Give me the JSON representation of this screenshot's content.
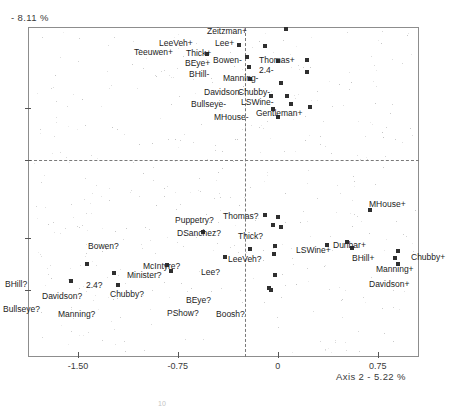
{
  "figure": {
    "y_axis_caption": "- 8.11 %",
    "x_axis_caption": "Axis 2  -  5.22 %",
    "artifact": "10"
  },
  "chart_data": {
    "type": "scatter",
    "title": "",
    "xlabel": "Axis 2  -  5.22 %",
    "ylabel": "- 8.11 %",
    "xlim": [
      -1.875,
      1.06
    ],
    "ylim": [
      -1.27,
      1.52
    ],
    "grid": false,
    "legend": null,
    "xticks": [
      -1.5,
      -0.75,
      0,
      0.75
    ],
    "xticklabels": [
      "-1.50",
      "-0.75",
      "0",
      "0.75"
    ],
    "yticks_unlabeled": 4,
    "reference_lines": {
      "vertical_x": 0,
      "horizontal_y": 0,
      "style": "dashed"
    },
    "groups": [
      {
        "name": "plus-group",
        "suffix": "+",
        "points": [
          {
            "label": "Zeitzman+",
            "x": 0.06,
            "y": 1.5,
            "lx": 207,
            "ly": 27
          },
          {
            "label": "LeeVeh+",
            "x": -0.29,
            "y": 1.37,
            "lx": 159,
            "ly": 39
          },
          {
            "label": "Lee+",
            "x": -0.1,
            "y": 1.36,
            "lx": 215,
            "ly": 39
          },
          {
            "label": "Teeuwen+",
            "x": -0.53,
            "y": 1.29,
            "lx": 134,
            "ly": 48
          },
          {
            "label": "Thick+",
            "x": -0.23,
            "y": 1.27,
            "lx": 186,
            "ly": 49
          },
          {
            "label": "BEye+",
            "x": -0.22,
            "y": 1.18,
            "lx": 185,
            "ly": 59
          },
          {
            "label": "Thomas+",
            "x": 0.22,
            "y": 1.24,
            "lx": 259,
            "ly": 56
          },
          {
            "label": "2.4-",
            "x": 0.22,
            "y": 1.14,
            "lx": 259,
            "ly": 66
          },
          {
            "label": "Gentleman+",
            "x": 0.24,
            "y": 0.84,
            "lx": 256,
            "ly": 109
          }
        ]
      },
      {
        "name": "minus-group",
        "suffix": "-",
        "points": [
          {
            "label": "Bowen-",
            "x": 0.0,
            "y": 1.23,
            "lx": 213,
            "ly": 56
          },
          {
            "label": "BHill-",
            "x": -0.21,
            "y": 1.08,
            "lx": 189,
            "ly": 70
          },
          {
            "label": "Manning-",
            "x": 0.02,
            "y": 1.05,
            "lx": 223,
            "ly": 74
          },
          {
            "label": "Davidson-",
            "x": -0.05,
            "y": 0.94,
            "lx": 204,
            "ly": 88
          },
          {
            "label": "Chubby-",
            "x": 0.07,
            "y": 0.94,
            "lx": 238,
            "ly": 88
          },
          {
            "label": "LSWine-",
            "x": 0.1,
            "y": 0.87,
            "lx": 241,
            "ly": 98
          },
          {
            "label": "Bullseye-",
            "x": -0.04,
            "y": 0.83,
            "lx": 191,
            "ly": 100
          },
          {
            "label": "MHouse-",
            "x": 0.0,
            "y": 0.76,
            "lx": 214,
            "ly": 113
          }
        ]
      },
      {
        "name": "question-group",
        "suffix": "?",
        "points": [
          {
            "label": "Puppetry?",
            "x": -0.1,
            "y": -0.07,
            "lx": 175,
            "ly": 216
          },
          {
            "label": "Thomas?",
            "x": 0.0,
            "y": -0.09,
            "lx": 223,
            "ly": 212
          },
          {
            "label": "DSanchez?",
            "x": -0.04,
            "y": -0.15,
            "lx": 177,
            "ly": 229
          },
          {
            "label": "Thick?",
            "x": 0.02,
            "y": -0.17,
            "lx": 238,
            "ly": 232
          },
          {
            "label": "Bowen?",
            "x": -0.56,
            "y": -0.21,
            "lx": 88,
            "ly": 242
          },
          {
            "label": "LeeVeh?",
            "x": -0.02,
            "y": -0.33,
            "lx": 228,
            "ly": 255
          },
          {
            "label": "McIntyre?",
            "x": -0.21,
            "y": -0.36,
            "lx": 143,
            "ly": 262
          },
          {
            "label": "Lee?",
            "x": -0.03,
            "y": -0.4,
            "lx": 201,
            "ly": 268
          },
          {
            "label": "Minister?",
            "x": -0.4,
            "y": -0.42,
            "lx": 127,
            "ly": 271
          },
          {
            "label": "BHill?",
            "x": -1.43,
            "y": -0.48,
            "lx": 5,
            "ly": 280
          },
          {
            "label": "2.4?",
            "x": -0.83,
            "y": -0.49,
            "lx": 86,
            "ly": 281
          },
          {
            "label": "Chubby?",
            "x": -0.8,
            "y": -0.54,
            "lx": 110,
            "ly": 290
          },
          {
            "label": "Davidson?",
            "x": -1.23,
            "y": -0.56,
            "lx": 42,
            "ly": 292
          },
          {
            "label": "BEye?",
            "x": -0.02,
            "y": -0.58,
            "lx": 186,
            "ly": 296
          },
          {
            "label": "Bullseye?",
            "x": -1.55,
            "y": -0.63,
            "lx": 3,
            "ly": 305
          },
          {
            "label": "Manning?",
            "x": -1.2,
            "y": -0.66,
            "lx": 58,
            "ly": 310
          },
          {
            "label": "PShow?",
            "x": -0.07,
            "y": -0.69,
            "lx": 167,
            "ly": 309
          },
          {
            "label": "Boosh?",
            "x": -0.05,
            "y": -0.7,
            "lx": 216,
            "ly": 310
          }
        ]
      },
      {
        "name": "right-plus-group",
        "suffix": "+",
        "points": [
          {
            "label": "MHouse+",
            "x": 0.69,
            "y": -0.03,
            "lx": 369,
            "ly": 200
          },
          {
            "label": "Dunbar+",
            "x": 0.52,
            "y": -0.3,
            "lx": 333,
            "ly": 241
          },
          {
            "label": "LSWine+",
            "x": 0.37,
            "y": -0.32,
            "lx": 296,
            "ly": 246
          },
          {
            "label": "BHill+",
            "x": 0.56,
            "y": -0.35,
            "lx": 352,
            "ly": 254
          },
          {
            "label": "Chubby+",
            "x": 0.9,
            "y": -0.37,
            "lx": 411,
            "ly": 253
          },
          {
            "label": "Manning+",
            "x": 0.88,
            "y": -0.43,
            "lx": 376,
            "ly": 265
          },
          {
            "label": "Davidson+",
            "x": 0.9,
            "y": -0.48,
            "lx": 369,
            "ly": 280
          }
        ]
      }
    ]
  }
}
